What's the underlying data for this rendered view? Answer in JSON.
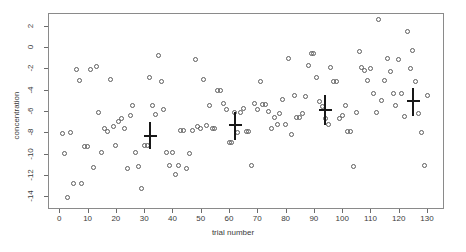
{
  "chart_data": {
    "type": "scatter",
    "title": "",
    "xlabel": "trial number",
    "ylabel": "concentration",
    "xlim": [
      -4,
      136
    ],
    "ylim": [
      -15.2,
      3.2
    ],
    "grid": false,
    "legend": null,
    "xticks": [
      0,
      10,
      20,
      30,
      40,
      50,
      60,
      70,
      80,
      90,
      100,
      110,
      120,
      130
    ],
    "xticklabels": [
      "0",
      "10",
      "20",
      "30",
      "40",
      "50",
      "60",
      "70",
      "80",
      "90",
      "100",
      "110",
      "120",
      "130"
    ],
    "yticks": [
      2,
      0,
      -2,
      -4,
      -6,
      -8,
      -10,
      -12,
      -14
    ],
    "yticklabels": [
      "2",
      "0",
      "-2",
      "-4",
      "-6",
      "-8",
      "-10",
      "-12",
      "-14"
    ],
    "marker": "open-circle",
    "marker_color": "#5d5d5d",
    "points": [
      [
        1,
        -8.1
      ],
      [
        2,
        -10.0
      ],
      [
        3,
        -14.1
      ],
      [
        4,
        -8.0
      ],
      [
        5,
        -12.8
      ],
      [
        6,
        -2.1
      ],
      [
        7,
        -3.1
      ],
      [
        8,
        -12.8
      ],
      [
        9,
        -9.3
      ],
      [
        10,
        -9.3
      ],
      [
        11,
        -2.1
      ],
      [
        12,
        -11.3
      ],
      [
        13,
        -1.8
      ],
      [
        14,
        -6.1
      ],
      [
        15,
        -9.9
      ],
      [
        16,
        -7.6
      ],
      [
        17,
        -7.9
      ],
      [
        18,
        -3.0
      ],
      [
        19,
        -7.5
      ],
      [
        20,
        -9.2
      ],
      [
        21,
        -7.0
      ],
      [
        22,
        -6.7
      ],
      [
        23,
        -7.6
      ],
      [
        24,
        -11.4
      ],
      [
        25,
        -6.4
      ],
      [
        26,
        -5.5
      ],
      [
        27,
        -9.9
      ],
      [
        28,
        -11.2
      ],
      [
        29,
        -13.3
      ],
      [
        30,
        -9.2
      ],
      [
        31,
        -9.2
      ],
      [
        32,
        -2.9
      ],
      [
        33,
        -5.5
      ],
      [
        34,
        -6.3
      ],
      [
        35,
        -0.8
      ],
      [
        36,
        -3.2
      ],
      [
        37,
        -5.9
      ],
      [
        38,
        -9.9
      ],
      [
        39,
        -11.1
      ],
      [
        40,
        -9.9
      ],
      [
        41,
        -12.0
      ],
      [
        42,
        -11.1
      ],
      [
        43,
        -7.8
      ],
      [
        44,
        -7.8
      ],
      [
        45,
        -11.4
      ],
      [
        46,
        -10.0
      ],
      [
        47,
        -7.8
      ],
      [
        48,
        -1.2
      ],
      [
        49,
        -7.5
      ],
      [
        50,
        -7.6
      ],
      [
        51,
        -3.0
      ],
      [
        52,
        -7.4
      ],
      [
        53,
        -5.5
      ],
      [
        54,
        -7.6
      ],
      [
        55,
        -7.6
      ],
      [
        56,
        -4.1
      ],
      [
        57,
        -4.1
      ],
      [
        58,
        -5.3
      ],
      [
        59,
        -5.9
      ],
      [
        60,
        -9.0
      ],
      [
        61,
        -9.0
      ],
      [
        62,
        -6.1
      ],
      [
        63,
        -8.0
      ],
      [
        64,
        -6.1
      ],
      [
        65,
        -5.8
      ],
      [
        66,
        -7.9
      ],
      [
        67,
        -7.9
      ],
      [
        68,
        -11.1
      ],
      [
        69,
        -5.3
      ],
      [
        70,
        -5.9
      ],
      [
        71,
        -3.2
      ],
      [
        72,
        -5.4
      ],
      [
        73,
        -5.4
      ],
      [
        74,
        -6.0
      ],
      [
        75,
        -7.6
      ],
      [
        76,
        -6.6
      ],
      [
        77,
        -7.3
      ],
      [
        78,
        -6.2
      ],
      [
        79,
        -4.9
      ],
      [
        80,
        -7.3
      ],
      [
        81,
        -1.1
      ],
      [
        82,
        -8.2
      ],
      [
        83,
        -4.5
      ],
      [
        84,
        -6.6
      ],
      [
        85,
        -6.6
      ],
      [
        86,
        -6.2
      ],
      [
        87,
        -4.6
      ],
      [
        88,
        -1.7
      ],
      [
        89,
        -0.6
      ],
      [
        90,
        -0.6
      ],
      [
        91,
        -2.9
      ],
      [
        92,
        -5.1
      ],
      [
        93,
        -5.6
      ],
      [
        94,
        -6.7
      ],
      [
        95,
        -7.3
      ],
      [
        96,
        -1.9
      ],
      [
        97,
        -3.2
      ],
      [
        98,
        -3.2
      ],
      [
        99,
        -6.7
      ],
      [
        100,
        -6.4
      ],
      [
        101,
        -5.5
      ],
      [
        102,
        -7.9
      ],
      [
        103,
        -7.9
      ],
      [
        104,
        -11.2
      ],
      [
        105,
        -6.1
      ],
      [
        106,
        -0.4
      ],
      [
        107,
        -1.9
      ],
      [
        108,
        -2.2
      ],
      [
        109,
        -3.1
      ],
      [
        110,
        -2.0
      ],
      [
        111,
        -4.4
      ],
      [
        112,
        -6.1
      ],
      [
        113,
        2.6
      ],
      [
        114,
        -5.0
      ],
      [
        115,
        -3.1
      ],
      [
        116,
        -1.1
      ],
      [
        117,
        -2.3
      ],
      [
        118,
        -4.4
      ],
      [
        119,
        -5.5
      ],
      [
        120,
        -1.2
      ],
      [
        121,
        -4.4
      ],
      [
        122,
        -6.5
      ],
      [
        123,
        1.5
      ],
      [
        124,
        -2.0
      ],
      [
        125,
        -0.3
      ],
      [
        126,
        -3.2
      ],
      [
        127,
        -6.2
      ],
      [
        128,
        -8.0
      ],
      [
        129,
        -11.1
      ],
      [
        130,
        -4.5
      ]
    ],
    "error_bars": [
      {
        "x": 32,
        "y": -8.3,
        "ymin": -9.6,
        "ymax": -7.0
      },
      {
        "x": 62,
        "y": -7.3,
        "ymin": -8.7,
        "ymax": -6.1
      },
      {
        "x": 94,
        "y": -5.9,
        "ymin": -7.3,
        "ymax": -4.5
      },
      {
        "x": 125,
        "y": -5.1,
        "ymin": -6.5,
        "ymax": -3.8
      }
    ],
    "error_bar_color": "#181818"
  }
}
